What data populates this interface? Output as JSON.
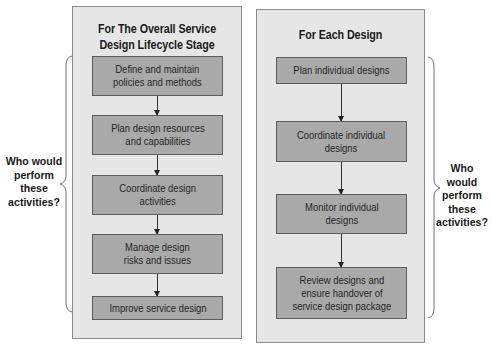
{
  "diagram": {
    "left_panel": {
      "title": "For The Overall Service\nDesign Lifecycle Stage",
      "title_line1": "For The Overall Service",
      "title_line2": "Design Lifecycle Stage",
      "steps": [
        {
          "label": "Define and maintain\npolicies and methods"
        },
        {
          "label": "Plan design resources\nand capabilities"
        },
        {
          "label": "Coordinate design\nactivities"
        },
        {
          "label": "Manage design\nrisks and issues"
        },
        {
          "label": "Improve service design"
        }
      ],
      "side_label": "Who would\nperform\nthese\nactivities?"
    },
    "right_panel": {
      "title": "For Each Design",
      "steps": [
        {
          "label": "Plan individual designs"
        },
        {
          "label": "Coordinate individual\ndesigns"
        },
        {
          "label": "Monitor individual\ndesigns"
        },
        {
          "label": "Review designs and\nensure handover of\nservice design package"
        }
      ],
      "side_label": "Who would\nperform\nthese\nactivities?"
    },
    "colors": {
      "panel_fill": "#e6e6e6",
      "box_fill": "#a9a9a9",
      "border": "#5c5c5c",
      "text": "#1a1a1a"
    }
  }
}
